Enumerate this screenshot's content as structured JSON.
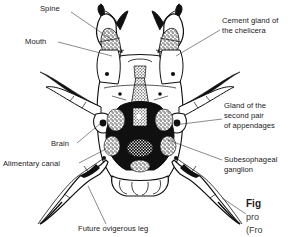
{
  "figure": {
    "kind": "labeled-anatomical-line-drawing",
    "background_color": "#ffffff",
    "ink_color": "#101010",
    "label_color": "#1a1a1a"
  },
  "labels": [
    {
      "id": "spine",
      "text": "Spine",
      "lines": [
        "Spine"
      ],
      "side": "left",
      "text_x": 40,
      "text_y": 11,
      "anchor": "start",
      "leader": "M 71,12 L 112,40"
    },
    {
      "id": "mouth",
      "text": "Mouth",
      "lines": [
        "Mouth"
      ],
      "side": "left",
      "text_x": 25,
      "text_y": 44,
      "anchor": "start",
      "leader": "M 58,42 L 112,56"
    },
    {
      "id": "cement-gland-of-the-chelicera",
      "text": "Cement gland of the chelicera",
      "lines": [
        "Cement gland of",
        "the chelicera"
      ],
      "side": "right",
      "text_x": 222,
      "text_y": 23,
      "anchor": "start",
      "leader": "M 220,30 L 176,56"
    },
    {
      "id": "gland-of-the-second-pair-of-appendages",
      "text": "Gland of the second pair of appendages",
      "lines": [
        "Gland of the",
        "second pair",
        "of appendages"
      ],
      "side": "right",
      "text_x": 224,
      "text_y": 108,
      "anchor": "start",
      "leader": "M 222,119 L 174,125"
    },
    {
      "id": "brain",
      "text": "Brain",
      "lines": [
        "Brain"
      ],
      "side": "left",
      "text_x": 51,
      "text_y": 146,
      "anchor": "start",
      "leader": "M 77,143 L 101,123"
    },
    {
      "id": "alimentary-canal",
      "text": "Alimentary canal",
      "lines": [
        "Alimentary canal"
      ],
      "side": "left",
      "text_x": 3,
      "text_y": 166,
      "anchor": "start",
      "leader": "M 79,163 L 106,149"
    },
    {
      "id": "subesophageal-ganglion",
      "text": "Subesophageal ganglion",
      "lines": [
        "Subesophageal",
        "ganglion"
      ],
      "side": "right",
      "text_x": 224,
      "text_y": 162,
      "anchor": "start",
      "leader": "M 222,160 L 168,140"
    },
    {
      "id": "future-ovigerous-leg",
      "text": "Future ovigerous leg",
      "lines": [
        "Future ovigerous leg"
      ],
      "side": "bottom",
      "text_x": 78,
      "text_y": 231,
      "anchor": "start",
      "leader": "M 106,224 L 88,186"
    }
  ],
  "caption": {
    "title_fragment": "Fig",
    "line2_fragment": "pro",
    "line3_fragment": "(Fro",
    "truncated": true,
    "x": 246,
    "y": 207
  }
}
